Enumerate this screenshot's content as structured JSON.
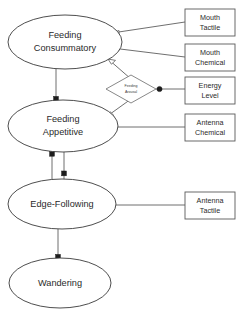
{
  "diagram": {
    "colors": {
      "background": "#ffffff",
      "node_stroke": "#3a3a3a",
      "box_stroke": "#5a5a5a",
      "link": "#5f5f5f",
      "marker": "#1d1d1d",
      "text": "#2a2a2a"
    },
    "behaviour_nodes": [
      {
        "id": "feeding-consummatory",
        "label_line1": "Feeding",
        "label_line2": "Consummatory",
        "cx": 65,
        "cy": 42,
        "rx": 57,
        "ry": 27
      },
      {
        "id": "feeding-appetitive",
        "label_line1": "Feeding",
        "label_line2": "Appetitive",
        "cx": 63,
        "cy": 126,
        "rx": 55,
        "ry": 26
      },
      {
        "id": "edge-following",
        "label_line1": "Edge-Following",
        "label_line2": "",
        "cx": 62,
        "cy": 204,
        "rx": 54,
        "ry": 25
      },
      {
        "id": "wandering",
        "label_line1": "Wandering",
        "label_line2": "",
        "cx": 60,
        "cy": 283,
        "rx": 51,
        "ry": 25
      }
    ],
    "stimulus_boxes": [
      {
        "id": "mouth-tactile",
        "label_line1": "Mouth",
        "label_line2": "Tactile",
        "x": 185,
        "y": 9,
        "w": 50,
        "h": 27
      },
      {
        "id": "mouth-chemical",
        "label_line1": "Mouth",
        "label_line2": "Chemical",
        "x": 185,
        "y": 44,
        "w": 50,
        "h": 27
      },
      {
        "id": "energy-level",
        "label_line1": "Energy",
        "label_line2": "Level",
        "x": 185,
        "y": 77,
        "w": 50,
        "h": 27
      },
      {
        "id": "antenna-chemical",
        "label_line1": "Antenna",
        "label_line2": "Chemical",
        "x": 185,
        "y": 114,
        "w": 50,
        "h": 27
      },
      {
        "id": "antenna-tactile",
        "label_line1": "Antenna",
        "label_line2": "Tactile",
        "x": 185,
        "y": 192,
        "w": 50,
        "h": 27
      }
    ],
    "modulator": {
      "id": "feeding-arousal",
      "label_line1": "Feeding",
      "label_line2": "Arousal",
      "cx": 131,
      "cy": 89,
      "rx": 25,
      "ry": 14
    },
    "connections": [
      {
        "id": "mouth-tactile-to-consummatory",
        "from": "mouth-tactile",
        "to": "feeding-consummatory",
        "style": "open-arrow"
      },
      {
        "id": "mouth-chemical-to-consummatory",
        "from": "mouth-chemical",
        "to": "feeding-consummatory",
        "style": "open-arrow"
      },
      {
        "id": "consummatory-to-arousal",
        "from": "feeding-consummatory",
        "to": "feeding-arousal",
        "style": "open-arrow"
      },
      {
        "id": "arousal-to-appetitive",
        "from": "feeding-arousal",
        "to": "feeding-appetitive",
        "style": "open-arrow"
      },
      {
        "id": "energy-level-to-arousal",
        "from": "energy-level",
        "to": "feeding-arousal",
        "style": "dot"
      },
      {
        "id": "antenna-chemical-to-appetitive",
        "from": "antenna-chemical",
        "to": "feeding-appetitive",
        "style": "open-arrow"
      },
      {
        "id": "antenna-tactile-to-edge-following",
        "from": "antenna-tactile",
        "to": "edge-following",
        "style": "open-arrow"
      },
      {
        "id": "consummatory-to-appetitive",
        "from": "feeding-consummatory",
        "to": "feeding-appetitive",
        "style": "dot"
      },
      {
        "id": "appetitive-to-edge-following-a",
        "from": "feeding-appetitive",
        "to": "edge-following",
        "style": "dot"
      },
      {
        "id": "appetitive-to-edge-following-b",
        "from": "feeding-appetitive",
        "to": "edge-following",
        "style": "dot"
      },
      {
        "id": "edge-following-to-wandering",
        "from": "edge-following",
        "to": "wandering",
        "style": "dot"
      }
    ]
  }
}
